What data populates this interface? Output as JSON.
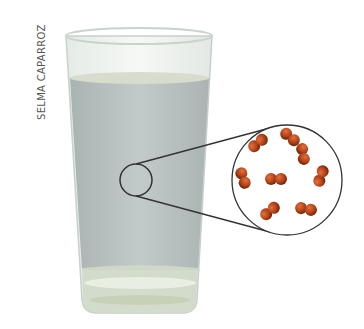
{
  "credit": "SELMA CAPARROZ",
  "scene": {
    "object": "glass-of-water",
    "magnifier": {
      "small_circle": {
        "cx": 136,
        "cy": 180,
        "r": 16
      },
      "large_circle": {
        "cx": 287,
        "cy": 180,
        "r": 55
      }
    },
    "molecules": [
      {
        "x": 258,
        "y": 143,
        "angle": -40
      },
      {
        "x": 290,
        "y": 137,
        "angle": 40
      },
      {
        "x": 303,
        "y": 154,
        "angle": 80
      },
      {
        "x": 243,
        "y": 178,
        "angle": 70
      },
      {
        "x": 276,
        "y": 179,
        "angle": 0
      },
      {
        "x": 321,
        "y": 176,
        "angle": -70
      },
      {
        "x": 270,
        "y": 211,
        "angle": -40
      },
      {
        "x": 306,
        "y": 209,
        "angle": 10
      }
    ],
    "colors": {
      "water": "#b9c2c2",
      "glass_rim": "#dfe6e1",
      "molecule": "#b3431a",
      "outline": "#333333"
    }
  }
}
